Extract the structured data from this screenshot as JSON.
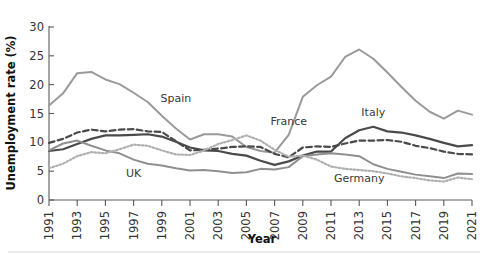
{
  "chart_data": {
    "type": "line",
    "title": "",
    "xlabel": "Year",
    "ylabel": "Unemployment rate (%)",
    "xlim": [
      1991,
      2021
    ],
    "ylim": [
      0,
      30
    ],
    "yticks": [
      0,
      5,
      10,
      15,
      20,
      25,
      30
    ],
    "xticks": [
      1991,
      1993,
      1995,
      1997,
      1999,
      2001,
      2003,
      2005,
      2007,
      2009,
      2011,
      2013,
      2015,
      2017,
      2019,
      2021
    ],
    "grid": false,
    "legend_position": "inline-labels",
    "x": [
      1991,
      1992,
      1993,
      1994,
      1995,
      1996,
      1997,
      1998,
      1999,
      2000,
      2001,
      2002,
      2003,
      2004,
      2005,
      2006,
      2007,
      2008,
      2009,
      2010,
      2011,
      2012,
      2013,
      2014,
      2015,
      2016,
      2017,
      2018,
      2019,
      2020,
      2021
    ],
    "series": [
      {
        "name": "Spain",
        "style": "solid",
        "color": "#9a9a9a",
        "width": 2.0,
        "label_x": 2000,
        "label_y": 17.0,
        "values": [
          16.4,
          18.5,
          22.0,
          22.2,
          20.9,
          20.1,
          18.6,
          17.0,
          14.6,
          12.4,
          10.5,
          11.4,
          11.4,
          11.0,
          9.2,
          8.5,
          8.2,
          11.3,
          17.9,
          19.9,
          21.4,
          24.8,
          26.1,
          24.5,
          22.1,
          19.6,
          17.2,
          15.3,
          14.1,
          15.5,
          14.8
        ]
      },
      {
        "name": "Italy",
        "style": "solid",
        "color": "#4a4a4a",
        "width": 2.2,
        "label_x": 2014,
        "label_y": 14.6,
        "values": [
          8.5,
          8.8,
          9.7,
          10.6,
          11.2,
          11.2,
          11.3,
          11.4,
          11.0,
          10.1,
          9.1,
          8.6,
          8.5,
          8.0,
          7.7,
          6.8,
          6.1,
          6.7,
          7.7,
          8.4,
          8.4,
          10.7,
          12.1,
          12.7,
          11.9,
          11.7,
          11.2,
          10.6,
          9.9,
          9.3,
          9.5
        ]
      },
      {
        "name": "France",
        "style": "dashed",
        "color": "#4a4a4a",
        "width": 2.2,
        "label_x": 2008,
        "label_y": 13.0,
        "values": [
          9.9,
          10.6,
          11.7,
          12.2,
          11.9,
          12.2,
          12.3,
          11.9,
          11.8,
          10.2,
          8.6,
          8.7,
          8.9,
          9.2,
          9.3,
          9.2,
          8.0,
          7.4,
          9.1,
          9.3,
          9.2,
          9.8,
          10.3,
          10.3,
          10.4,
          10.1,
          9.4,
          9.0,
          8.4,
          8.0,
          7.9
        ]
      },
      {
        "name": "UK",
        "style": "solid",
        "color": "#8f8f8f",
        "width": 2.0,
        "label_x": 1997,
        "label_y": 4.0,
        "values": [
          8.6,
          9.8,
          10.3,
          9.4,
          8.6,
          8.1,
          7.0,
          6.3,
          6.0,
          5.5,
          5.1,
          5.2,
          5.0,
          4.7,
          4.8,
          5.4,
          5.3,
          5.7,
          7.6,
          7.9,
          8.1,
          7.9,
          7.6,
          6.2,
          5.4,
          4.9,
          4.4,
          4.1,
          3.8,
          4.6,
          4.5
        ]
      },
      {
        "name": "Germany",
        "style": "dotted",
        "color": "#b0b0b0",
        "width": 2.2,
        "label_x": 2013,
        "label_y": 3.2,
        "values": [
          5.5,
          6.3,
          7.6,
          8.3,
          8.1,
          8.8,
          9.6,
          9.4,
          8.6,
          7.9,
          7.8,
          8.6,
          9.7,
          10.4,
          11.2,
          10.3,
          8.7,
          7.5,
          7.7,
          7.0,
          5.8,
          5.4,
          5.2,
          5.0,
          4.6,
          4.1,
          3.8,
          3.4,
          3.2,
          3.9,
          3.6
        ]
      }
    ]
  },
  "geometry": {
    "plot_left": 49,
    "plot_right": 472,
    "plot_top": 27,
    "plot_bottom": 200
  }
}
